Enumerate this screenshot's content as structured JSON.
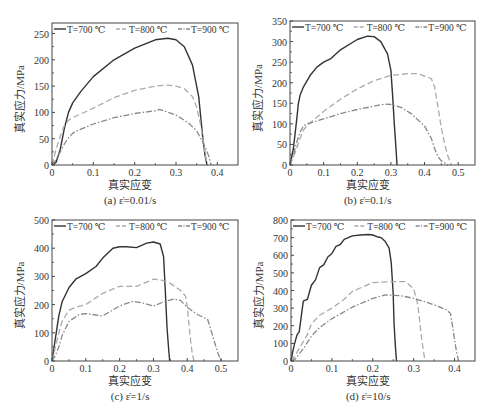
{
  "figure": {
    "legend": {
      "entries": [
        {
          "label": "T=700 ℃",
          "style": "solid"
        },
        {
          "label": "T=800 ℃",
          "style": "dash"
        },
        {
          "label": "T=900 ℃",
          "style": "dashdot"
        }
      ]
    },
    "colors": {
      "t700": "#333333",
      "t800": "#aaaaaa",
      "t900": "#888888",
      "axis": "#444444"
    }
  },
  "chart_data": [
    {
      "id": "a",
      "type": "line",
      "caption": "(a) ε̇=0.01/s",
      "xlabel": "真实应变",
      "ylabel": "真实应力/MPa",
      "xlim": [
        0,
        0.45
      ],
      "ylim": [
        0,
        270
      ],
      "xticks": [
        0,
        0.1,
        0.2,
        0.3,
        0.4
      ],
      "xtick_labels": [
        "0",
        "0.1",
        "0.2",
        "0.3",
        "0.4"
      ],
      "yticks": [
        0,
        50,
        100,
        150,
        200,
        250
      ],
      "ytick_labels": [
        "0",
        "50",
        "100",
        "150",
        "200",
        "250"
      ],
      "frame": {
        "left": 52,
        "top": 23,
        "right": 238,
        "bottom": 165
      },
      "legend_position": "top",
      "series": [
        {
          "name": "T=700 ℃",
          "style": "solid",
          "x": [
            0,
            0.01,
            0.02,
            0.03,
            0.04,
            0.05,
            0.07,
            0.1,
            0.15,
            0.2,
            0.25,
            0.28,
            0.3,
            0.32,
            0.34,
            0.355,
            0.36,
            0.365,
            0.37,
            0.375
          ],
          "y": [
            0,
            5,
            30,
            70,
            100,
            118,
            140,
            168,
            200,
            222,
            238,
            241,
            238,
            225,
            190,
            130,
            90,
            50,
            20,
            0
          ]
        },
        {
          "name": "T=800 ℃",
          "style": "dash",
          "x": [
            0,
            0.01,
            0.02,
            0.03,
            0.04,
            0.05,
            0.1,
            0.15,
            0.2,
            0.25,
            0.28,
            0.3,
            0.32,
            0.34,
            0.35,
            0.36,
            0.365,
            0.37,
            0.375
          ],
          "y": [
            0,
            30,
            55,
            75,
            85,
            90,
            108,
            128,
            142,
            150,
            152,
            150,
            145,
            130,
            110,
            75,
            50,
            25,
            0
          ]
        },
        {
          "name": "T=900 ℃",
          "style": "dashdot",
          "x": [
            0,
            0.01,
            0.02,
            0.03,
            0.04,
            0.05,
            0.06,
            0.1,
            0.15,
            0.2,
            0.25,
            0.26,
            0.3,
            0.33,
            0.35,
            0.36,
            0.37,
            0.38,
            0.385
          ],
          "y": [
            0,
            10,
            25,
            40,
            52,
            60,
            65,
            78,
            90,
            98,
            103,
            106,
            95,
            80,
            65,
            50,
            35,
            15,
            0
          ]
        }
      ]
    },
    {
      "id": "b",
      "type": "line",
      "caption": "(b) ε̇=0.1/s",
      "xlabel": "真实应变",
      "ylabel": "真实应力/MPa",
      "xlim": [
        0,
        0.55
      ],
      "ylim": [
        0,
        350
      ],
      "xticks": [
        0,
        0.1,
        0.2,
        0.3,
        0.4,
        0.5
      ],
      "xtick_labels": [
        "0",
        "0.1",
        "0.2",
        "0.3",
        "0.4",
        "0.5"
      ],
      "yticks": [
        0,
        50,
        100,
        150,
        200,
        250,
        300,
        350
      ],
      "ytick_labels": [
        "0",
        "50",
        "100",
        "150",
        "200",
        "250",
        "300",
        "350"
      ],
      "frame": {
        "left": 290,
        "top": 21,
        "right": 475,
        "bottom": 165
      },
      "legend_position": "top",
      "series": [
        {
          "name": "T=700 ℃",
          "style": "solid",
          "x": [
            0,
            0.01,
            0.02,
            0.025,
            0.03,
            0.04,
            0.06,
            0.08,
            0.1,
            0.12,
            0.15,
            0.2,
            0.23,
            0.25,
            0.27,
            0.29,
            0.3,
            0.305,
            0.31,
            0.315,
            0.318
          ],
          "y": [
            0,
            40,
            110,
            150,
            170,
            190,
            218,
            238,
            250,
            258,
            280,
            305,
            313,
            312,
            300,
            270,
            230,
            170,
            100,
            40,
            0
          ]
        },
        {
          "name": "T=800 ℃",
          "style": "dash",
          "x": [
            0,
            0.01,
            0.02,
            0.03,
            0.04,
            0.05,
            0.1,
            0.15,
            0.2,
            0.25,
            0.3,
            0.35,
            0.38,
            0.42,
            0.43,
            0.44,
            0.45,
            0.46,
            0.47,
            0.48
          ],
          "y": [
            0,
            20,
            40,
            65,
            85,
            95,
            130,
            160,
            185,
            205,
            218,
            222,
            222,
            210,
            190,
            140,
            90,
            50,
            20,
            0
          ]
        },
        {
          "name": "T=900 ℃",
          "style": "dashdot",
          "x": [
            0,
            0.01,
            0.02,
            0.03,
            0.04,
            0.05,
            0.1,
            0.15,
            0.2,
            0.25,
            0.28,
            0.3,
            0.33,
            0.36,
            0.4,
            0.42,
            0.43,
            0.44,
            0.45,
            0.47
          ],
          "y": [
            0,
            25,
            55,
            80,
            95,
            100,
            112,
            125,
            135,
            143,
            148,
            147,
            140,
            125,
            95,
            65,
            40,
            20,
            10,
            0
          ]
        }
      ]
    },
    {
      "id": "c",
      "type": "line",
      "caption": "(c) ε̇=1/s",
      "xlabel": "真实应变",
      "ylabel": "真实应力/MPa",
      "xlim": [
        0,
        0.55
      ],
      "ylim": [
        0,
        500
      ],
      "xticks": [
        0,
        0.1,
        0.2,
        0.3,
        0.4,
        0.5
      ],
      "xtick_labels": [
        "0",
        "0.1",
        "0.2",
        "0.3",
        "0.4",
        "0.5"
      ],
      "yticks": [
        0,
        100,
        200,
        300,
        400,
        500
      ],
      "ytick_labels": [
        "0",
        "100",
        "200",
        "300",
        "400",
        "500"
      ],
      "frame": {
        "left": 52,
        "top": 220,
        "right": 238,
        "bottom": 361
      },
      "legend_position": "top",
      "series": [
        {
          "name": "T=700 ℃",
          "style": "solid",
          "x": [
            0,
            0.01,
            0.02,
            0.03,
            0.05,
            0.07,
            0.1,
            0.13,
            0.15,
            0.18,
            0.2,
            0.22,
            0.25,
            0.28,
            0.3,
            0.32,
            0.33,
            0.335,
            0.34,
            0.345,
            0.348
          ],
          "y": [
            0,
            80,
            160,
            210,
            260,
            290,
            310,
            335,
            365,
            400,
            405,
            405,
            402,
            418,
            422,
            415,
            370,
            250,
            120,
            40,
            0
          ]
        },
        {
          "name": "T=800 ℃",
          "style": "dash",
          "x": [
            0,
            0.01,
            0.02,
            0.03,
            0.05,
            0.07,
            0.1,
            0.15,
            0.2,
            0.25,
            0.3,
            0.32,
            0.35,
            0.38,
            0.395,
            0.4,
            0.405,
            0.41,
            0.415,
            0.42
          ],
          "y": [
            0,
            50,
            100,
            140,
            180,
            190,
            200,
            240,
            265,
            265,
            290,
            288,
            275,
            250,
            230,
            190,
            130,
            70,
            25,
            0
          ]
        },
        {
          "name": "T=900 ℃",
          "style": "dashdot",
          "x": [
            0,
            0.01,
            0.02,
            0.03,
            0.05,
            0.08,
            0.1,
            0.15,
            0.2,
            0.24,
            0.27,
            0.3,
            0.33,
            0.36,
            0.38,
            0.4,
            0.43,
            0.46,
            0.47,
            0.48,
            0.49,
            0.5
          ],
          "y": [
            0,
            20,
            50,
            90,
            140,
            165,
            168,
            160,
            195,
            212,
            205,
            195,
            210,
            220,
            215,
            190,
            165,
            148,
            110,
            70,
            30,
            0
          ]
        }
      ]
    },
    {
      "id": "d",
      "type": "line",
      "caption": "(d) ε̇=10/s",
      "xlabel": "真实应变",
      "ylabel": "真实应力/MPa",
      "xlim": [
        0,
        0.45
      ],
      "ylim": [
        0,
        800
      ],
      "xticks": [
        0,
        0.1,
        0.2,
        0.3,
        0.4
      ],
      "xtick_labels": [
        "0",
        "0.1",
        "0.2",
        "0.3",
        "0.4"
      ],
      "yticks": [
        0,
        100,
        200,
        300,
        400,
        500,
        600,
        700,
        800
      ],
      "ytick_labels": [
        "0",
        "100",
        "200",
        "300",
        "400",
        "500",
        "600",
        "700",
        "800"
      ],
      "frame": {
        "left": 291,
        "top": 220,
        "right": 475,
        "bottom": 361
      },
      "legend_position": "top",
      "series": [
        {
          "name": "T=700 ℃",
          "style": "solid",
          "x": [
            0,
            0.005,
            0.01,
            0.015,
            0.02,
            0.025,
            0.03,
            0.035,
            0.04,
            0.05,
            0.06,
            0.07,
            0.08,
            0.09,
            0.1,
            0.11,
            0.12,
            0.13,
            0.15,
            0.17,
            0.19,
            0.2,
            0.21,
            0.22,
            0.23,
            0.24,
            0.245,
            0.25,
            0.252,
            0.255,
            0.258
          ],
          "y": [
            0,
            60,
            110,
            150,
            165,
            250,
            340,
            345,
            350,
            430,
            460,
            530,
            545,
            590,
            610,
            650,
            660,
            690,
            710,
            715,
            718,
            715,
            705,
            700,
            680,
            640,
            560,
            380,
            220,
            90,
            0
          ]
        },
        {
          "name": "T=800 ℃",
          "style": "dash",
          "x": [
            0,
            0.01,
            0.02,
            0.03,
            0.04,
            0.05,
            0.07,
            0.1,
            0.13,
            0.15,
            0.2,
            0.25,
            0.28,
            0.3,
            0.31,
            0.315,
            0.32,
            0.325,
            0.328
          ],
          "y": [
            0,
            30,
            70,
            110,
            150,
            210,
            260,
            300,
            350,
            395,
            445,
            450,
            450,
            410,
            320,
            220,
            120,
            40,
            0
          ]
        },
        {
          "name": "T=900 ℃",
          "style": "dashdot",
          "x": [
            0,
            0.01,
            0.02,
            0.03,
            0.05,
            0.07,
            0.1,
            0.15,
            0.2,
            0.23,
            0.27,
            0.3,
            0.33,
            0.36,
            0.38,
            0.39,
            0.395,
            0.4,
            0.405,
            0.41
          ],
          "y": [
            0,
            10,
            40,
            70,
            140,
            190,
            240,
            305,
            355,
            375,
            370,
            355,
            335,
            310,
            290,
            270,
            200,
            120,
            50,
            0
          ]
        }
      ]
    }
  ]
}
